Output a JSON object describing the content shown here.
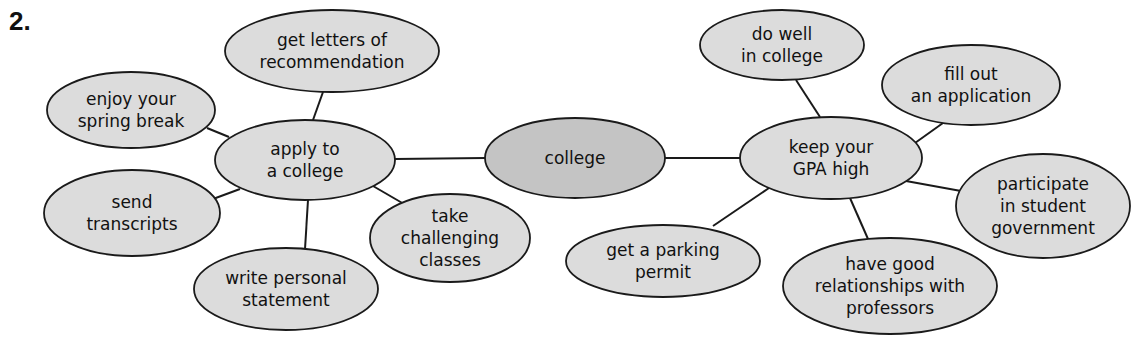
{
  "problem_number": "2.",
  "colors": {
    "node_fill": "#dcdcdc",
    "center_fill": "#c4c4c4",
    "stroke": "#1a1a1a",
    "text": "#111111"
  },
  "nodes": [
    {
      "id": "college",
      "lines": [
        "college"
      ],
      "cx": 575,
      "cy": 158,
      "rx": 90,
      "ry": 40,
      "center": true
    },
    {
      "id": "apply",
      "lines": [
        "apply to",
        "a college"
      ],
      "cx": 305,
      "cy": 160,
      "rx": 90,
      "ry": 40
    },
    {
      "id": "gpa",
      "lines": [
        "keep your",
        "GPA high"
      ],
      "cx": 831,
      "cy": 158,
      "rx": 91,
      "ry": 41
    },
    {
      "id": "letters",
      "lines": [
        "get letters of",
        "recommendation"
      ],
      "cx": 332,
      "cy": 51,
      "rx": 107,
      "ry": 41
    },
    {
      "id": "spring",
      "lines": [
        "enjoy your",
        "spring break"
      ],
      "cx": 131,
      "cy": 110,
      "rx": 84,
      "ry": 38
    },
    {
      "id": "transcripts",
      "lines": [
        "send",
        "transcripts"
      ],
      "cx": 132,
      "cy": 213,
      "rx": 88,
      "ry": 43
    },
    {
      "id": "statement",
      "lines": [
        "write personal",
        "statement"
      ],
      "cx": 286,
      "cy": 289,
      "rx": 92,
      "ry": 41
    },
    {
      "id": "classes",
      "lines": [
        "take",
        "challenging",
        "classes"
      ],
      "cx": 450,
      "cy": 238,
      "rx": 80,
      "ry": 44
    },
    {
      "id": "dowell",
      "lines": [
        "do well",
        "in college"
      ],
      "cx": 782,
      "cy": 45,
      "rx": 82,
      "ry": 35
    },
    {
      "id": "fillout",
      "lines": [
        "fill out",
        "an application"
      ],
      "cx": 971,
      "cy": 85,
      "rx": 89,
      "ry": 40
    },
    {
      "id": "government",
      "lines": [
        "participate",
        "in student",
        "government"
      ],
      "cx": 1043,
      "cy": 206,
      "rx": 87,
      "ry": 52
    },
    {
      "id": "parking",
      "lines": [
        "get a parking",
        "permit"
      ],
      "cx": 663,
      "cy": 261,
      "rx": 97,
      "ry": 36
    },
    {
      "id": "professors",
      "lines": [
        "have good",
        "relationships with",
        "professors"
      ],
      "cx": 890,
      "cy": 286,
      "rx": 107,
      "ry": 48
    }
  ],
  "edges": [
    {
      "from": "college",
      "to": "apply",
      "x1": 485,
      "y1": 158,
      "x2": 395,
      "y2": 159
    },
    {
      "from": "college",
      "to": "gpa",
      "x1": 665,
      "y1": 158,
      "x2": 740,
      "y2": 158
    },
    {
      "from": "apply",
      "to": "letters",
      "x1": 313,
      "y1": 120,
      "x2": 323,
      "y2": 92
    },
    {
      "from": "apply",
      "to": "spring",
      "x1": 229,
      "y1": 137,
      "x2": 207,
      "y2": 128
    },
    {
      "from": "apply",
      "to": "transcripts",
      "x1": 240,
      "y1": 189,
      "x2": 213,
      "y2": 199
    },
    {
      "from": "apply",
      "to": "statement",
      "x1": 308,
      "y1": 200,
      "x2": 305,
      "y2": 249
    },
    {
      "from": "apply",
      "to": "classes",
      "x1": 373,
      "y1": 186,
      "x2": 404,
      "y2": 204
    },
    {
      "from": "gpa",
      "to": "dowell",
      "x1": 820,
      "y1": 117,
      "x2": 796,
      "y2": 80
    },
    {
      "from": "gpa",
      "to": "fillout",
      "x1": 915,
      "y1": 143,
      "x2": 943,
      "y2": 123
    },
    {
      "from": "gpa",
      "to": "government",
      "x1": 906,
      "y1": 181,
      "x2": 961,
      "y2": 191
    },
    {
      "from": "gpa",
      "to": "parking",
      "x1": 769,
      "y1": 188,
      "x2": 713,
      "y2": 226
    },
    {
      "from": "gpa",
      "to": "professors",
      "x1": 850,
      "y1": 198,
      "x2": 868,
      "y2": 239
    }
  ]
}
